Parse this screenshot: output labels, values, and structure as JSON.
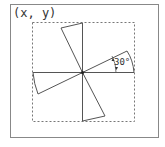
{
  "diagram": {
    "coordinate_label": "(x, y)",
    "angle_label": "30°",
    "rotation_angle_deg": 30,
    "colors": {
      "frame": "#888888",
      "stroke": "#555555",
      "dashed": "#777777",
      "text": "#333333"
    }
  }
}
